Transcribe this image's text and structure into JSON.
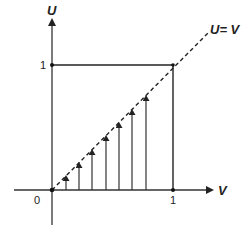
{
  "diagram": {
    "type": "coordinate-region",
    "axes": {
      "y_label": "U",
      "x_label": "V"
    },
    "ticks": {
      "origin": "0",
      "x_one": "1",
      "y_one": "1"
    },
    "line_label": "U= V",
    "region": "unit square [0,1]x[0,1]",
    "arrows": {
      "count": 7,
      "direction": "up",
      "description": "vertical arrows from V-axis up to the line U = V"
    },
    "colors": {
      "stroke": "#222222",
      "background": "#ffffff"
    }
  }
}
